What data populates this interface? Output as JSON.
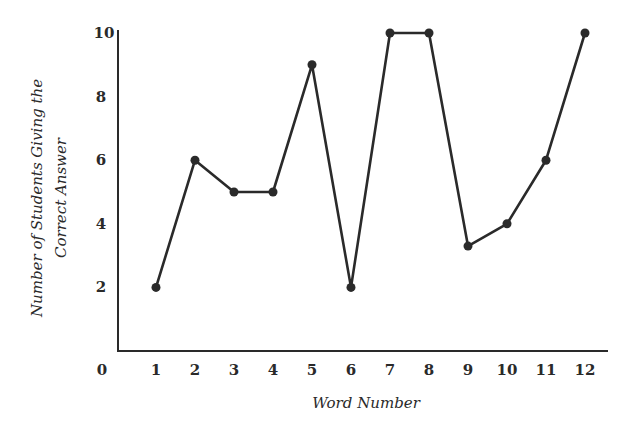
{
  "chart_data": {
    "type": "line",
    "title": "",
    "xlabel": "Word Number",
    "ylabel": "Number of Students Giving the Correct Answer",
    "ylabel_lines": [
      "Number of Students Giving the",
      "Correct Answer"
    ],
    "x": [
      1,
      2,
      3,
      4,
      5,
      6,
      7,
      8,
      9,
      10,
      11,
      12
    ],
    "series": [
      {
        "name": "Correct answers",
        "values": [
          2,
          6,
          5,
          5,
          9,
          2,
          10,
          10,
          3.3,
          4,
          6,
          10
        ]
      }
    ],
    "x_tick_labels": [
      "0",
      "1",
      "2",
      "3",
      "4",
      "5",
      "6",
      "7",
      "8",
      "9",
      "10",
      "11",
      "12"
    ],
    "y_tick_labels": [
      "2",
      "4",
      "6",
      "8",
      "10"
    ],
    "xlim": [
      0,
      12
    ],
    "ylim": [
      0,
      10
    ],
    "grid": false,
    "legend": null,
    "marker": "filled-circle",
    "line_color": "#2a2a2a"
  }
}
